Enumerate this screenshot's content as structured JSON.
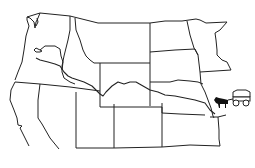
{
  "map": {
    "type": "outline map",
    "region": "Western United States",
    "background_color": "#ffffff",
    "line_color": "#222222",
    "states_outlined": [
      "Washington",
      "Oregon",
      "California",
      "Nevada",
      "Idaho",
      "Montana",
      "Wyoming",
      "Utah",
      "Colorado",
      "North Dakota",
      "South Dakota",
      "Nebraska",
      "Kansas",
      "Minnesota",
      "Iowa",
      "Missouri"
    ],
    "route": {
      "name": "trail-route",
      "description": "Trail line running from eastern Kansas/Missouri border west through Nebraska, Wyoming, Idaho to Oregon"
    },
    "icons": [
      {
        "name": "covered-wagon-icon",
        "description": "ox-drawn covered wagon at eastern trailhead"
      }
    ]
  }
}
